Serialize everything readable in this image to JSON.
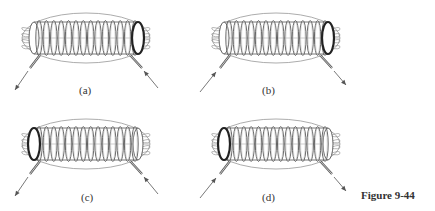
{
  "figure": {
    "caption": "Figure 9-44",
    "panels": [
      {
        "id": "a",
        "label": "(a)",
        "open_end": "right",
        "lead_left": "out",
        "lead_right": "in",
        "ox": 0,
        "oy": 0
      },
      {
        "id": "b",
        "label": "(b)",
        "open_end": "right",
        "lead_left": "in",
        "lead_right": "out",
        "ox": 190,
        "oy": 0
      },
      {
        "id": "c",
        "label": "(c)",
        "open_end": "left",
        "lead_left": "out",
        "lead_right": "in",
        "ox": 0,
        "oy": 106
      },
      {
        "id": "d",
        "label": "(d)",
        "open_end": "left",
        "lead_left": "in",
        "lead_right": "out",
        "ox": 190,
        "oy": 106
      }
    ],
    "turns": 14,
    "colors": {
      "line": "#555555",
      "field": "#888888",
      "bg": "#ffffff"
    }
  }
}
